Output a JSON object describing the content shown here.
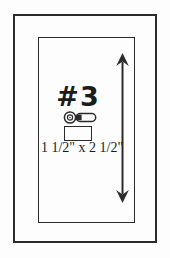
{
  "diagram": {
    "part_label": "#3",
    "dimension_text": "1 1/2\" x 2 1/2\"",
    "colors": {
      "line": "#2b2b2b",
      "text": "#1c1c1c",
      "background": "#fdfdfd"
    },
    "icons": {
      "hardware": "knob-side-view-icon",
      "height_indicator": "vertical-double-arrow-icon"
    }
  }
}
